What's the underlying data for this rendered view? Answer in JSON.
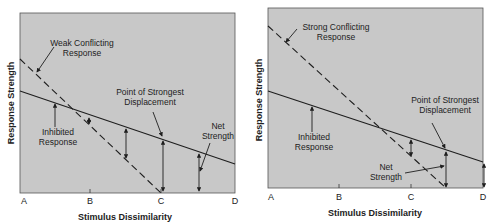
{
  "colors": {
    "plot_bg": "#c8c8c8",
    "ink": "#1e1e1e",
    "page_bg": "#ffffff"
  },
  "panels": [
    {
      "id": "weak",
      "x_label": "Stimulus Dissimilarity",
      "y_label": "Response Strength",
      "x_ticks": [
        "A",
        "B",
        "C",
        "D"
      ],
      "annotations": {
        "conflicting": [
          "Weak Conflicting",
          "Response"
        ],
        "inhibited": [
          "Inhibited",
          "Response"
        ],
        "displacement": [
          "Point of Strongest",
          "Displacement"
        ],
        "net": [
          "Net",
          "Strength"
        ]
      }
    },
    {
      "id": "strong",
      "x_label": "Stimulus Dissimilarity",
      "y_label": "Response Strength",
      "x_ticks": [
        "A",
        "B",
        "C",
        "D"
      ],
      "annotations": {
        "conflicting": [
          "Strong Conflicting",
          "Response"
        ],
        "inhibited": [
          "Inhibited",
          "Response"
        ],
        "displacement": [
          "Point of Strongest",
          "Displacement"
        ],
        "net": [
          "Net",
          "Strength"
        ]
      }
    }
  ]
}
